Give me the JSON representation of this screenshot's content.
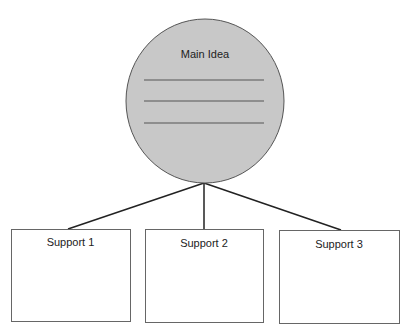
{
  "diagram": {
    "type": "main-idea-support-web",
    "main_idea": {
      "label": "Main Idea",
      "fill": "#c8c8c8",
      "writing_lines": 3
    },
    "supports": [
      {
        "label": "Support 1"
      },
      {
        "label": "Support 2"
      },
      {
        "label": "Support 3"
      }
    ]
  }
}
